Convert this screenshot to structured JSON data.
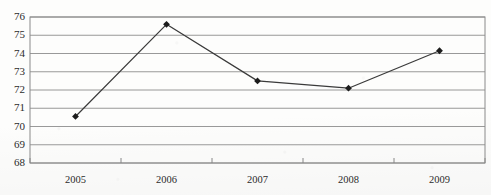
{
  "chart_data": {
    "type": "line",
    "title": "",
    "subtitle": "",
    "xlabel": "",
    "ylabel": "",
    "categories": [
      "2005",
      "2006",
      "2007",
      "2008",
      "2009"
    ],
    "series": [
      {
        "name": "series-1",
        "values": [
          70.55,
          75.6,
          72.5,
          72.1,
          74.15
        ]
      }
    ],
    "ylim": [
      68,
      76
    ],
    "ytick_labels": [
      "76",
      "75",
      "74",
      "73",
      "72",
      "71",
      "70",
      "69",
      "68"
    ],
    "ytick_values": [
      76,
      75,
      74,
      73,
      72,
      71,
      70,
      69,
      68
    ],
    "ystep": 1,
    "grid": true,
    "grid_axis": "y",
    "legend": false,
    "legend_position": "none",
    "marker": "diamond",
    "colors": {
      "line": "#3a3a3a",
      "marker": "#1c1c1c",
      "grid": "#8d8d8d",
      "axis": "#7a7a7a",
      "text": "#2b2b2b",
      "background": "#fdfdfc"
    }
  },
  "plot": {
    "left": 30,
    "top": 17,
    "right": 485,
    "bottom": 163
  }
}
